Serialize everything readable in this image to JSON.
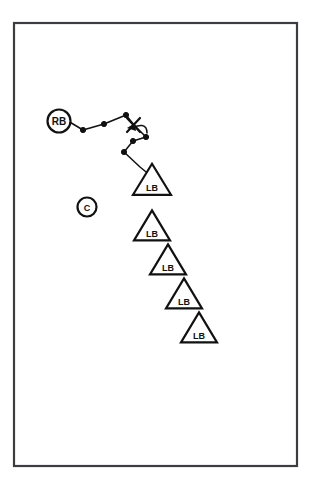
{
  "figure": {
    "background_color": "#ffffff",
    "ink_color": "#111111",
    "frame_color": "#3d3d41"
  },
  "frame": {
    "x": 14,
    "y": 23,
    "width": 283,
    "height": 443
  },
  "chart_data": {
    "type": "scatter",
    "title": "",
    "xlabel": "",
    "ylabel": "",
    "xlim": [
      14,
      297
    ],
    "ylim": [
      23,
      466
    ],
    "grid": false,
    "legend": "none",
    "series": [
      {
        "name": "track",
        "type": "line",
        "label": "waypoint track",
        "points": [
          {
            "x": 68,
            "y": 121
          },
          {
            "x": 83,
            "y": 130
          },
          {
            "x": 104,
            "y": 124
          },
          {
            "x": 126,
            "y": 115
          },
          {
            "x": 134,
            "y": 125
          },
          {
            "x": 146,
            "y": 137
          },
          {
            "x": 133,
            "y": 141
          },
          {
            "x": 124,
            "y": 152
          },
          {
            "x": 140,
            "y": 167
          },
          {
            "x": 151,
            "y": 176
          }
        ]
      },
      {
        "name": "dots",
        "type": "scatter",
        "label": "track vertices",
        "points": [
          {
            "x": 83,
            "y": 130
          },
          {
            "x": 104,
            "y": 124
          },
          {
            "x": 126,
            "y": 115
          },
          {
            "x": 146,
            "y": 137
          },
          {
            "x": 133,
            "y": 141
          },
          {
            "x": 124,
            "y": 152
          }
        ]
      }
    ],
    "annotations": [
      {
        "kind": "x-marker",
        "label": "X",
        "x": 133,
        "y": 125
      },
      {
        "kind": "curved-arrow",
        "from_x": 141,
        "to_x": 130,
        "y": 130
      }
    ]
  },
  "nodes": {
    "circles": [
      {
        "id": "rb",
        "label": "RB",
        "x": 59,
        "y": 121,
        "r": 11.5,
        "font_size": 10
      },
      {
        "id": "c",
        "label": "C",
        "x": 87,
        "y": 207,
        "r": 9.5,
        "font_size": 9
      }
    ],
    "triangles": [
      {
        "id": "lb-1",
        "label": "LB",
        "cx": 152,
        "cy": 183,
        "half_width": 19,
        "height": 31,
        "font_size": 9
      },
      {
        "id": "lb-2",
        "label": "LB",
        "cx": 152,
        "cy": 229,
        "half_width": 18,
        "height": 30,
        "font_size": 9
      },
      {
        "id": "lb-3",
        "label": "LB",
        "cx": 168,
        "cy": 263,
        "half_width": 18,
        "height": 30,
        "font_size": 9
      },
      {
        "id": "lb-4",
        "label": "LB",
        "cx": 184,
        "cy": 297,
        "half_width": 18,
        "height": 30,
        "font_size": 9
      },
      {
        "id": "lb-5",
        "label": "LB",
        "cx": 199,
        "cy": 331,
        "half_width": 18,
        "height": 30,
        "font_size": 9
      }
    ]
  },
  "legend_keys": {
    "rb": "RB",
    "c": "C",
    "lb": "LB"
  }
}
